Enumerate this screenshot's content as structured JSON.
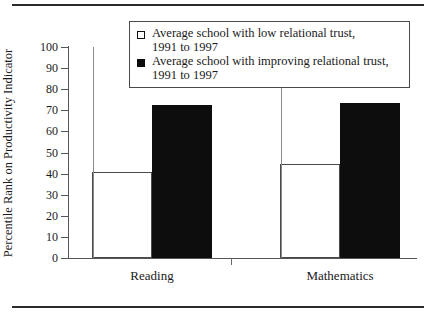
{
  "chart_data": {
    "type": "bar",
    "title": "",
    "xlabel": "",
    "ylabel": "Percentile Rank on Productivity Indicator",
    "ylim": [
      0,
      100
    ],
    "yticks": [
      0,
      10,
      20,
      30,
      40,
      50,
      60,
      70,
      80,
      90,
      100
    ],
    "ytick_labels": [
      "0",
      "10",
      "20",
      "30",
      "40",
      "50",
      "60",
      "70",
      "80",
      "90",
      "100"
    ],
    "grid": false,
    "legend_position": "top-center",
    "categories": [
      "Reading",
      "Mathematics"
    ],
    "series": [
      {
        "name": "Average school with low relational trust, 1991 to 1997",
        "style": "open",
        "color": "#ffffff",
        "edge_color": "#4a4a4a",
        "values": [
          41,
          44.5
        ]
      },
      {
        "name": "Average school with improving relational trust, 1991 to 1997",
        "style": "filled",
        "color": "#0d0d0d",
        "edge_color": "#0d0d0d",
        "values": [
          72.5,
          73.5
        ]
      }
    ]
  },
  "legend": {
    "entries": [
      {
        "swatch": "open-square",
        "line1": "Average school with low relational trust,",
        "line2": "1991 to 1997"
      },
      {
        "swatch": "filled-square",
        "line1": "Average school with improving relational trust,",
        "line2": "1991 to 1997"
      }
    ]
  },
  "axes": {
    "y_title": "Percentile Rank on Productivity Indicator",
    "y_tick_labels": [
      "100",
      "90",
      "80",
      "70",
      "60",
      "50",
      "40",
      "30",
      "20",
      "10",
      "0"
    ],
    "x_category_labels": [
      "Reading",
      "Mathematics"
    ]
  }
}
